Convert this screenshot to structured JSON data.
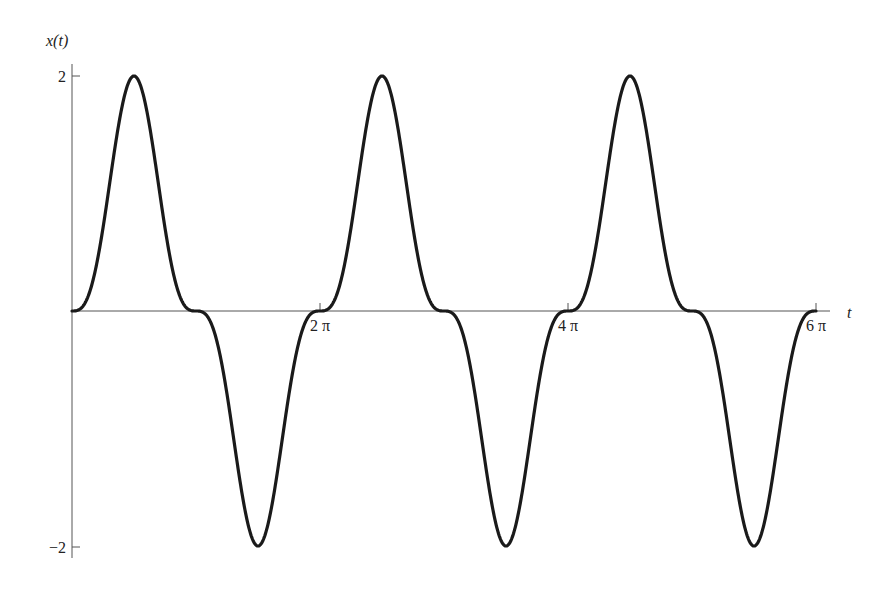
{
  "chart_data": {
    "type": "line",
    "title": "",
    "xlabel": "t",
    "ylabel": "x(t)",
    "function": "2 sin^3(t)",
    "xlim": [
      0,
      18.8496
    ],
    "ylim": [
      -2,
      2
    ],
    "x_ticks": [
      {
        "value": 6.2832,
        "label": "2 π"
      },
      {
        "value": 12.5664,
        "label": "4 π"
      },
      {
        "value": 18.8496,
        "label": "6 π"
      }
    ],
    "y_ticks": [
      {
        "value": 2,
        "label": "2"
      },
      {
        "value": -2,
        "label": "−2"
      }
    ],
    "grid": false,
    "legend": null,
    "series": [
      {
        "name": "x(t)",
        "color": "#1a1a1a",
        "x": [
          0,
          0.7854,
          1.5708,
          2.3562,
          3.1416,
          3.927,
          4.7124,
          5.4978,
          6.2832,
          7.0686,
          7.854,
          8.6394,
          9.4248,
          10.2102,
          10.9956,
          11.781,
          12.5664,
          13.3518,
          14.1372,
          14.9226,
          15.708,
          16.4934,
          17.2788,
          18.0642,
          18.8496
        ],
        "values": [
          0,
          0.707,
          2,
          0.707,
          0,
          -0.707,
          -2,
          -0.707,
          0,
          0.707,
          2,
          0.707,
          0,
          -0.707,
          -2,
          -0.707,
          0,
          0.707,
          2,
          0.707,
          0,
          -0.707,
          -2,
          -0.707,
          0
        ]
      }
    ]
  },
  "labels": {
    "y_axis": "x(t)",
    "x_axis": "t",
    "y_tick_top": "2",
    "y_tick_bottom": "−2",
    "x_tick_1": "2 π",
    "x_tick_2": "4 π",
    "x_tick_3": "6 π"
  }
}
